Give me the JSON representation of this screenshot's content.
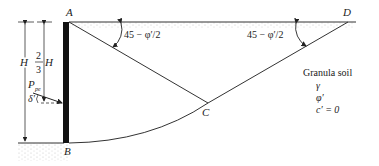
{
  "diagram": {
    "points": {
      "A": "A",
      "B": "B",
      "C": "C",
      "D": "D"
    },
    "angle_left": "45 − φ′/2",
    "angle_right": "45 − φ′/2",
    "height_label": "H",
    "two_thirds_num": "2",
    "two_thirds_den": "3",
    "two_thirds_H": "H",
    "force_label": "P",
    "force_sub": "pe",
    "delta_label": "δ′",
    "soil": {
      "title": "Granula soil",
      "gamma": "γ",
      "phi": "φ′",
      "cohesion": "c′ = 0"
    }
  }
}
